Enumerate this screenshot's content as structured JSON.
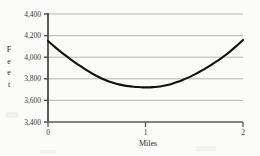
{
  "chart_data": {
    "type": "line",
    "title": "",
    "subtitle": "",
    "xlabel": "Miles",
    "ylabel": "Feet",
    "ylabel_letters": [
      "F",
      "e",
      "e",
      "t"
    ],
    "xlim": [
      0,
      2
    ],
    "ylim": [
      3400,
      4400
    ],
    "xticks": [
      0,
      1,
      2
    ],
    "xtick_labels": [
      "0",
      "1",
      "2"
    ],
    "yticks": [
      3400,
      3600,
      3800,
      4000,
      4200,
      4400
    ],
    "ytick_labels": [
      "3,400",
      "3,600",
      "3,800",
      "4,000",
      "4,200",
      "4,400"
    ],
    "grid": true,
    "grid_axis": "y",
    "legend": null,
    "series": [
      {
        "name": "Elevation profile",
        "color": "#111111",
        "x": [
          0.0,
          0.05,
          0.1,
          0.15,
          0.2,
          0.25,
          0.3,
          0.35,
          0.4,
          0.45,
          0.5,
          0.55,
          0.6,
          0.65,
          0.7,
          0.75,
          0.8,
          0.85,
          0.9,
          0.95,
          1.0,
          1.05,
          1.1,
          1.15,
          1.2,
          1.25,
          1.3,
          1.35,
          1.4,
          1.45,
          1.5,
          1.55,
          1.6,
          1.65,
          1.7,
          1.75,
          1.8,
          1.85,
          1.9,
          1.95,
          2.0
        ],
        "values": [
          4150,
          4110,
          4072,
          4036,
          4001,
          3968,
          3936,
          3906,
          3877,
          3850,
          3825,
          3803,
          3784,
          3768,
          3754,
          3743,
          3735,
          3729,
          3725,
          3722,
          3720,
          3721,
          3724,
          3729,
          3737,
          3748,
          3762,
          3778,
          3796,
          3816,
          3838,
          3862,
          3888,
          3915,
          3944,
          3974,
          4005,
          4040,
          4078,
          4118,
          4160
        ]
      }
    ],
    "annotations": []
  },
  "axes": {
    "x_axis_color": "#555555",
    "y_axis_color": "#555555",
    "grid_color": "#b9b9b9"
  }
}
